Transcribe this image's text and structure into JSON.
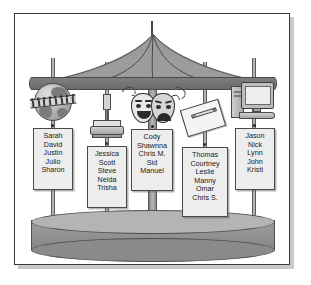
{
  "illustration": {
    "title": "Carousel of student groups",
    "frame": {
      "border_color": "#3a3a3a",
      "background": "#ffffff"
    },
    "carousel": {
      "canopy_color": "#8c8c8c",
      "base_color": "#9d9d9d",
      "pole_color": "#9a9a9a"
    },
    "stations": [
      {
        "icon": "globe-icon",
        "icon_label": "globe with people",
        "card_name": "name-card-social-studies",
        "names": [
          "Sarah",
          "David",
          "Justin",
          "Julio",
          "Sharon"
        ]
      },
      {
        "icon": "microscope-icon",
        "icon_label": "microscope",
        "card_name": "name-card-science",
        "names": [
          "Jessica",
          "Scott",
          "Steve",
          "Nelda",
          "Trisha"
        ]
      },
      {
        "icon": "theater-masks-icon",
        "icon_label": "comedy and tragedy masks",
        "card_name": "name-card-drama",
        "names": [
          "Cody",
          "Shawnna",
          "Chris M.",
          "Sid",
          "Manuel"
        ]
      },
      {
        "icon": "paper-pencil-icon",
        "icon_label": "paper with pencil",
        "card_name": "name-card-writing",
        "names": [
          "Thomas",
          "Courtney",
          "Leslie",
          "Manny",
          "Omar",
          "Chris S."
        ]
      },
      {
        "icon": "computer-icon",
        "icon_label": "desktop computer",
        "card_name": "name-card-technology",
        "names": [
          "Jason",
          "Nick",
          "Lynn",
          "John",
          "Kristi"
        ]
      }
    ]
  }
}
